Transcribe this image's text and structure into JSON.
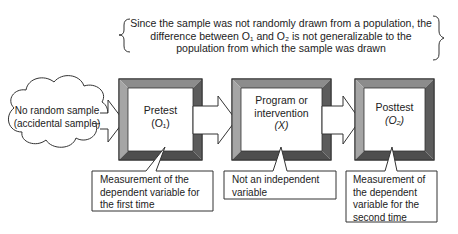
{
  "top_note": {
    "lines": [
      "Since the sample was not randomly drawn from a population, the",
      "difference between O₁ and O₂ is not generalizable to the",
      "population from which the sample was drawn"
    ]
  },
  "cloud": {
    "lines": [
      "No random sample",
      "(accidental sample)"
    ]
  },
  "boxes": [
    {
      "lines": [
        "Pretest",
        "(O₁)"
      ]
    },
    {
      "lines": [
        "Program or",
        "intervention",
        "(X)"
      ]
    },
    {
      "lines": [
        "Posttest",
        "(O₂)"
      ]
    }
  ],
  "callouts": [
    {
      "lines": [
        "Measurement of the",
        "dependent variable for",
        "the first time"
      ]
    },
    {
      "lines": [
        "Not an independent",
        "variable"
      ]
    },
    {
      "lines": [
        "Measurement of",
        "the dependent",
        "variable for the",
        "second time"
      ]
    }
  ],
  "colors": {
    "bevel_light": "#9a9a9a",
    "bevel_mid": "#7a7a7a",
    "bevel_dark": "#555555",
    "stroke": "#333333"
  }
}
